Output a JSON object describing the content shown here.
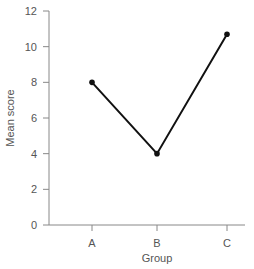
{
  "chart_data": {
    "type": "line",
    "title": "",
    "xlabel": "Group",
    "ylabel": "Mean score",
    "categories": [
      "A",
      "B",
      "C"
    ],
    "values": [
      8,
      4,
      10.7
    ],
    "ylim": [
      0,
      12
    ],
    "yticks": [
      0,
      2,
      4,
      6,
      8,
      10,
      12
    ],
    "grid": false,
    "legend": null,
    "markers": true,
    "line_color": "#111111",
    "axis_color": "#888888"
  }
}
